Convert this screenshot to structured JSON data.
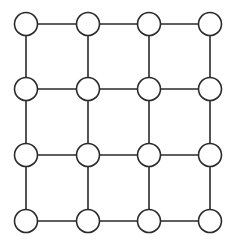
{
  "diagram": {
    "type": "grid-graph",
    "rows": 4,
    "cols": 4,
    "node_radius": 11.5,
    "col_x": [
      26,
      88,
      149,
      210
    ],
    "row_y": [
      24,
      89,
      155,
      221
    ],
    "colors": {
      "stroke": "#2a2a2a",
      "node_fill": "#ffffff",
      "background": "#ffffff"
    },
    "nodes": [
      {
        "id": "n-0-0",
        "row": 0,
        "col": 0
      },
      {
        "id": "n-0-1",
        "row": 0,
        "col": 1
      },
      {
        "id": "n-0-2",
        "row": 0,
        "col": 2
      },
      {
        "id": "n-0-3",
        "row": 0,
        "col": 3
      },
      {
        "id": "n-1-0",
        "row": 1,
        "col": 0
      },
      {
        "id": "n-1-1",
        "row": 1,
        "col": 1
      },
      {
        "id": "n-1-2",
        "row": 1,
        "col": 2
      },
      {
        "id": "n-1-3",
        "row": 1,
        "col": 3
      },
      {
        "id": "n-2-0",
        "row": 2,
        "col": 0
      },
      {
        "id": "n-2-1",
        "row": 2,
        "col": 1
      },
      {
        "id": "n-2-2",
        "row": 2,
        "col": 2
      },
      {
        "id": "n-2-3",
        "row": 2,
        "col": 3
      },
      {
        "id": "n-3-0",
        "row": 3,
        "col": 0
      },
      {
        "id": "n-3-1",
        "row": 3,
        "col": 1
      },
      {
        "id": "n-3-2",
        "row": 3,
        "col": 2
      },
      {
        "id": "n-3-3",
        "row": 3,
        "col": 3
      }
    ],
    "edges": "4-neighbour lattice: every node connected to its right and lower neighbour"
  }
}
